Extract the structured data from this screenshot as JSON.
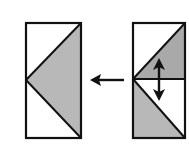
{
  "diagram": {
    "colors": {
      "stroke": "#111111",
      "fill_shaded": "#b8b8b8",
      "fill_shaded_dark": "#a9a9a9",
      "background": "#ffffff"
    },
    "left_block": {
      "x": 26,
      "y": 23,
      "width": 55,
      "height": 115,
      "triangle_points": "81,23 26,80 81,138"
    },
    "right_block": {
      "x": 133,
      "y": 23,
      "width": 52,
      "height": 115,
      "divider_y": 79,
      "upper_shaded_points": "133,79 185,23 185,79",
      "lower_shaded_points": "133,79 133,138 185,138"
    },
    "transform_arrow": {
      "x1": 124,
      "x2": 90,
      "y": 80
    },
    "flip_arrow": {
      "x": 159,
      "y1": 58,
      "y2": 101
    }
  }
}
